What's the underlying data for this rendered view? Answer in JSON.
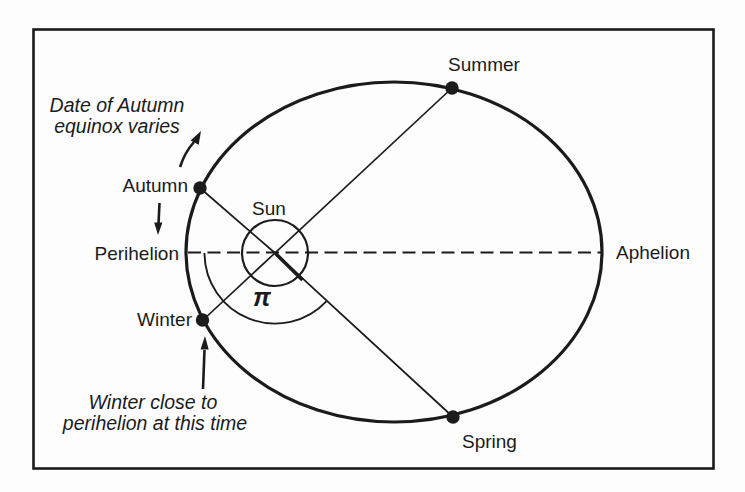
{
  "diagram": {
    "sun_label": "Sun",
    "pi_symbol": "π",
    "points": {
      "summer": "Summer",
      "autumn": "Autumn",
      "winter": "Winter",
      "spring": "Spring"
    },
    "apsides": {
      "perihelion": "Perihelion",
      "aphelion": "Aphelion"
    },
    "notes": {
      "autumn_equinox": {
        "line1": "Date of Autumn",
        "line2": "equinox varies"
      },
      "winter_perihelion": {
        "line1": "Winter close to",
        "line2": "perihelion at this time"
      }
    },
    "colors": {
      "ink": "#1b1b1b",
      "paper": "#fdfdfd"
    }
  }
}
